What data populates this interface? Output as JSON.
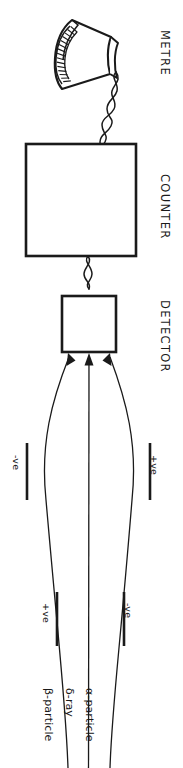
{
  "figure": {
    "orientation": "rotated-90",
    "background_color": "#ffffff",
    "ink_color": "#1a1a1a",
    "section_labels": [
      {
        "id": "metre",
        "text": "METRE"
      },
      {
        "id": "counter",
        "text": "COUNTER"
      },
      {
        "id": "detector",
        "text": "DETECTOR"
      }
    ],
    "components": {
      "metre": {
        "name": "analogue meter",
        "shape": "fan-sector-dial",
        "tick_count": 17
      },
      "counter": {
        "name": "counter box",
        "shape": "rectangle"
      },
      "detector": {
        "name": "detector box",
        "shape": "rectangle"
      },
      "wires": [
        {
          "id": "metre-to-counter",
          "style": "twisted-pair"
        },
        {
          "id": "counter-to-detector",
          "style": "twisted-pair"
        }
      ]
    },
    "deflection_plates": [
      {
        "id": "upper-left-plate",
        "text": "-ve"
      },
      {
        "id": "upper-right-plate",
        "text": "+ve"
      },
      {
        "id": "lower-left-plate",
        "text": "+ve"
      },
      {
        "id": "lower-right-plate",
        "text": "-ve"
      }
    ],
    "beams": [
      {
        "id": "beta",
        "text": "β-particle",
        "deflection": "toward-positive-plate"
      },
      {
        "id": "delta",
        "text": "δ-ray",
        "deflection": "undeflected"
      },
      {
        "id": "alpha",
        "text": "α-particle",
        "deflection": "toward-negative-plate"
      }
    ],
    "arrow_count_into_detector": 3
  }
}
